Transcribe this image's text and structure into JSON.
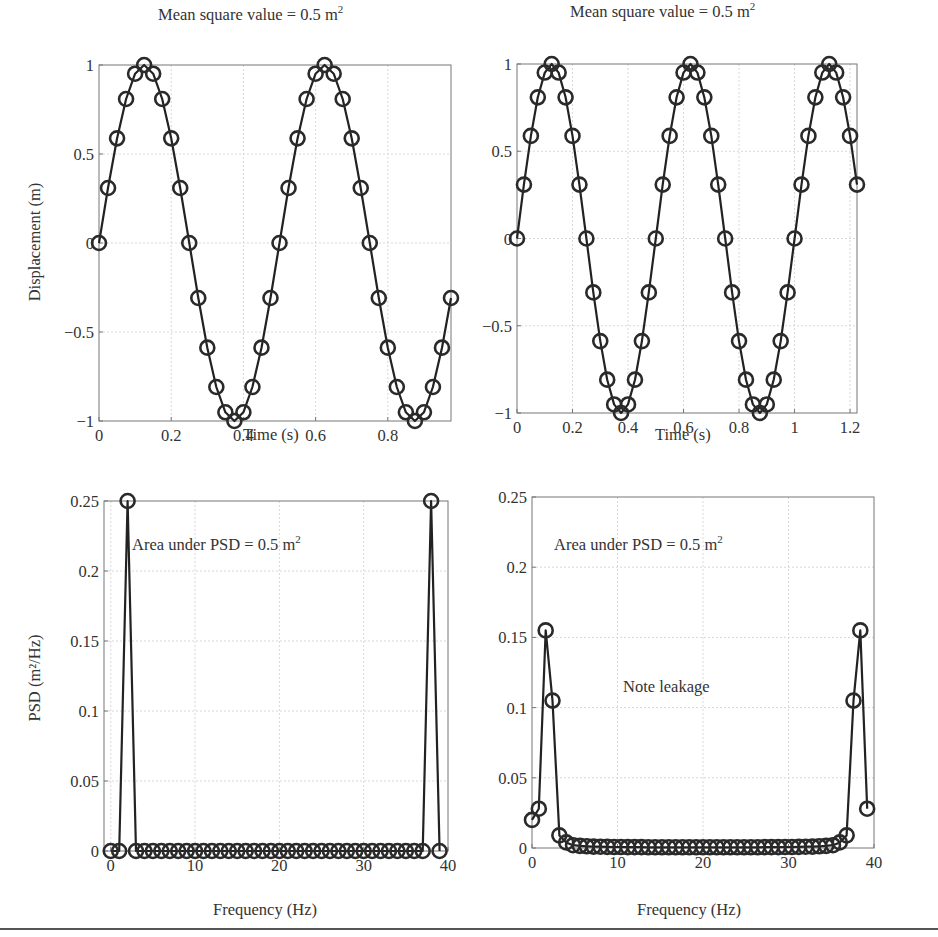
{
  "figure": {
    "panels": [
      {
        "id": "time-40",
        "title": "Mean square value = 0.5 m",
        "title_sup": "2",
        "xlabel": "Time (s)",
        "ylabel": "Displacement (m)"
      },
      {
        "id": "time-50",
        "title": "Mean square value = 0.5 m",
        "title_sup": "2",
        "xlabel": "Time (s)",
        "ylabel": ""
      },
      {
        "id": "psd-40",
        "title": "",
        "xlabel": "Frequency (Hz)",
        "ylabel": "PSD (m²/Hz)",
        "annotation": "Area under PSD = 0.5 m",
        "annotation_sup": "2"
      },
      {
        "id": "psd-50",
        "title": "",
        "xlabel": "Frequency (Hz)",
        "ylabel": "",
        "annotation": "Area under PSD = 0.5 m",
        "annotation_sup": "2",
        "annotation2": "Note leakage"
      }
    ]
  },
  "chart_data": [
    {
      "type": "line",
      "title": "Mean square value = 0.5 m^2",
      "xlabel": "Time (s)",
      "ylabel": "Displacement (m)",
      "markers": "circle",
      "grid": true,
      "xlim": [
        0,
        0.975
      ],
      "ylim": [
        -1,
        1
      ],
      "xticks": [
        0,
        0.2,
        0.4,
        0.6,
        0.8
      ],
      "xtick_labels": [
        "0",
        "0.2",
        "0.4",
        "0.6",
        "0.8"
      ],
      "yticks": [
        -1,
        -0.5,
        0,
        0.5,
        1
      ],
      "ytick_labels": [
        "−1",
        "−0.5",
        "0",
        "0.5",
        "1"
      ],
      "signal": "sin(2*pi*2*t), N=40, dt=0.025 s",
      "x": [
        0,
        0.025,
        0.05,
        0.075,
        0.1,
        0.125,
        0.15,
        0.175,
        0.2,
        0.225,
        0.25,
        0.275,
        0.3,
        0.325,
        0.35,
        0.375,
        0.4,
        0.425,
        0.45,
        0.475,
        0.5,
        0.525,
        0.55,
        0.575,
        0.6,
        0.625,
        0.65,
        0.675,
        0.7,
        0.725,
        0.75,
        0.775,
        0.8,
        0.825,
        0.85,
        0.875,
        0.9,
        0.925,
        0.95,
        0.975
      ],
      "y": [
        0,
        0.309,
        0.588,
        0.809,
        0.951,
        1,
        0.951,
        0.809,
        0.588,
        0.309,
        0,
        -0.309,
        -0.588,
        -0.809,
        -0.951,
        -1,
        -0.951,
        -0.809,
        -0.588,
        -0.309,
        0,
        0.309,
        0.588,
        0.809,
        0.951,
        1,
        0.951,
        0.809,
        0.588,
        0.309,
        0,
        -0.309,
        -0.588,
        -0.809,
        -0.951,
        -1,
        -0.951,
        -0.809,
        -0.588,
        -0.309
      ],
      "box_px": [
        99,
        65,
        451,
        421
      ]
    },
    {
      "type": "line",
      "title": "Mean square value = 0.5 m^2",
      "xlabel": "Time (s)",
      "ylabel": "",
      "markers": "circle",
      "grid": true,
      "xlim": [
        0,
        1.225
      ],
      "ylim": [
        -1,
        1
      ],
      "xticks": [
        0,
        0.2,
        0.4,
        0.6,
        0.8,
        1,
        1.2
      ],
      "xtick_labels": [
        "0",
        "0.2",
        "0.4",
        "0.6",
        "0.8",
        "1",
        "1.2"
      ],
      "yticks": [
        -1,
        -0.5,
        0,
        0.5,
        1
      ],
      "ytick_labels": [
        "−1",
        "−0.5",
        "0",
        "0.5",
        "1"
      ],
      "signal": "sin(2*pi*2*t), N=50, dt=0.025 s",
      "x": [
        0,
        0.025,
        0.05,
        0.075,
        0.1,
        0.125,
        0.15,
        0.175,
        0.2,
        0.225,
        0.25,
        0.275,
        0.3,
        0.325,
        0.35,
        0.375,
        0.4,
        0.425,
        0.45,
        0.475,
        0.5,
        0.525,
        0.55,
        0.575,
        0.6,
        0.625,
        0.65,
        0.675,
        0.7,
        0.725,
        0.75,
        0.775,
        0.8,
        0.825,
        0.85,
        0.875,
        0.9,
        0.925,
        0.95,
        0.975,
        1.0,
        1.025,
        1.05,
        1.075,
        1.1,
        1.125,
        1.15,
        1.175,
        1.2,
        1.225
      ],
      "y": [
        0,
        0.309,
        0.588,
        0.809,
        0.951,
        1,
        0.951,
        0.809,
        0.588,
        0.309,
        0,
        -0.309,
        -0.588,
        -0.809,
        -0.951,
        -1,
        -0.951,
        -0.809,
        -0.588,
        -0.309,
        0,
        0.309,
        0.588,
        0.809,
        0.951,
        1,
        0.951,
        0.809,
        0.588,
        0.309,
        0,
        -0.309,
        -0.588,
        -0.809,
        -0.951,
        -1,
        -0.951,
        -0.809,
        -0.588,
        -0.309,
        0,
        0.309,
        0.588,
        0.809,
        0.951,
        1,
        0.951,
        0.809,
        0.588,
        0.309
      ],
      "box_px": [
        517,
        64,
        857,
        413
      ]
    },
    {
      "type": "line",
      "title": "",
      "xlabel": "Frequency (Hz)",
      "ylabel": "PSD (m^2/Hz)",
      "markers": "circle",
      "grid": true,
      "xlim": [
        -0.8,
        40
      ],
      "ylim": [
        0,
        0.25
      ],
      "xticks": [
        0,
        10,
        20,
        30,
        40
      ],
      "xtick_labels": [
        "0",
        "10",
        "20",
        "30",
        "40"
      ],
      "yticks": [
        0,
        0.05,
        0.1,
        0.15,
        0.2,
        0.25
      ],
      "ytick_labels": [
        "0",
        "0.05",
        "0.1",
        "0.15",
        "0.2",
        "0.25"
      ],
      "annotations": [
        "Area under PSD = 0.5 m^2"
      ],
      "df": 1,
      "x": [
        0,
        1,
        2,
        3,
        4,
        5,
        6,
        7,
        8,
        9,
        10,
        11,
        12,
        13,
        14,
        15,
        16,
        17,
        18,
        19,
        20,
        21,
        22,
        23,
        24,
        25,
        26,
        27,
        28,
        29,
        30,
        31,
        32,
        33,
        34,
        35,
        36,
        37,
        38,
        39
      ],
      "y": [
        0,
        0,
        0.25,
        0,
        0,
        0,
        0,
        0,
        0,
        0,
        0,
        0,
        0,
        0,
        0,
        0,
        0,
        0,
        0,
        0,
        0,
        0,
        0,
        0,
        0,
        0,
        0,
        0,
        0,
        0,
        0,
        0,
        0,
        0,
        0,
        0,
        0,
        0,
        0.25,
        0
      ],
      "box_px": [
        104,
        501,
        448,
        851
      ]
    },
    {
      "type": "line",
      "title": "",
      "xlabel": "Frequency (Hz)",
      "ylabel": "",
      "markers": "circle",
      "grid": true,
      "xlim": [
        0,
        40
      ],
      "ylim": [
        0,
        0.25
      ],
      "xticks": [
        0,
        10,
        20,
        30,
        40
      ],
      "xtick_labels": [
        "0",
        "10",
        "20",
        "30",
        "40"
      ],
      "yticks": [
        0,
        0.05,
        0.1,
        0.15,
        0.2,
        0.25
      ],
      "ytick_labels": [
        "0",
        "0.05",
        "0.1",
        "0.15",
        "0.2",
        "0.25"
      ],
      "annotations": [
        "Area under PSD = 0.5 m^2",
        "Note leakage"
      ],
      "df": 0.8,
      "x": [
        0,
        0.8,
        1.6,
        2.4,
        3.2,
        4.0,
        4.8,
        5.6,
        6.4,
        7.2,
        8.0,
        8.8,
        9.6,
        10.4,
        11.2,
        12.0,
        12.8,
        13.6,
        14.4,
        15.2,
        16.0,
        16.8,
        17.6,
        18.4,
        19.2,
        20.0,
        20.8,
        21.6,
        22.4,
        23.2,
        24.0,
        24.8,
        25.6,
        26.4,
        27.2,
        28.0,
        28.8,
        29.6,
        30.4,
        31.2,
        32.0,
        32.8,
        33.6,
        34.4,
        35.2,
        36.0,
        36.8,
        37.6,
        38.4,
        39.2
      ],
      "y": [
        0.02,
        0.028,
        0.155,
        0.105,
        0.009,
        0.004,
        0.002,
        0.0015,
        0.0012,
        0.001,
        0.0009,
        0.0008,
        0.0007,
        0.0007,
        0.0006,
        0.0006,
        0.0006,
        0.0005,
        0.0005,
        0.0005,
        0.0005,
        0.0005,
        0.0005,
        0.0005,
        0.0005,
        0.0005,
        0.0005,
        0.0005,
        0.0005,
        0.0005,
        0.0005,
        0.0005,
        0.0005,
        0.0005,
        0.0006,
        0.0006,
        0.0006,
        0.0007,
        0.0007,
        0.0008,
        0.0009,
        0.001,
        0.0012,
        0.0015,
        0.002,
        0.004,
        0.009,
        0.105,
        0.155,
        0.028
      ],
      "box_px": [
        532,
        497,
        874,
        848
      ]
    }
  ]
}
